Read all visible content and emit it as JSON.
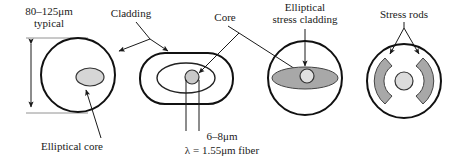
{
  "figure": {
    "labels": {
      "diameter": "80–125μm",
      "diameter_second_line": "typical",
      "cladding": "Cladding",
      "core": "Core",
      "elliptical_stress_cladding_line1": "Elliptical",
      "elliptical_stress_cladding_line2": "stress cladding",
      "stress_rods": "Stress rods",
      "elliptical_core": "Elliptical core",
      "core_diameter": "6–8μm",
      "wavelength": "λ = 1.55μm fiber"
    },
    "colors": {
      "outline": "#111111",
      "core_fill": "#d6d6d6",
      "stress_fill": "#a8a8a8",
      "background": "#ffffff",
      "text": "#1a1a1a"
    },
    "cross_sections": [
      {
        "name": "elliptical-core-fiber",
        "cladding_shape": "circle",
        "core_shape": "ellipse",
        "core_offset": "right-of-center"
      },
      {
        "name": "stadium-cladding-fiber",
        "cladding_shape": "rounded-rectangle",
        "inner_shape": "ellipse",
        "core_shape": "circle"
      },
      {
        "name": "elliptical-stress-cladding-fiber",
        "cladding_shape": "circle",
        "stress_shape": "wide-ellipse",
        "core_shape": "circle"
      },
      {
        "name": "stress-rods-fiber",
        "cladding_shape": "circle",
        "rods": 2,
        "rod_shape": "bowtie-sector",
        "core_shape": "circle"
      }
    ]
  }
}
